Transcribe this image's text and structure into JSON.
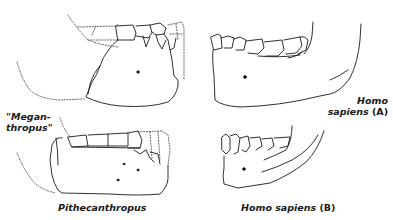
{
  "figure": {
    "specimens": [
      {
        "id": "meganthropus",
        "label_line1": "\"Megan-",
        "label_line2": "thropus\""
      },
      {
        "id": "pithecanthropus",
        "label": "Pithecanthropus"
      },
      {
        "id": "homo-sapiens-a",
        "label_line1": "Homo",
        "label_line2_italic": "sapiens",
        "label_line2_suffix": "(A)"
      },
      {
        "id": "homo-sapiens-b",
        "label_italic": "Homo sapiens",
        "label_suffix": "(B)"
      }
    ],
    "colors": {
      "ink": "#1a1a1a",
      "dotted": "#555555",
      "background": "#ffffff"
    }
  }
}
